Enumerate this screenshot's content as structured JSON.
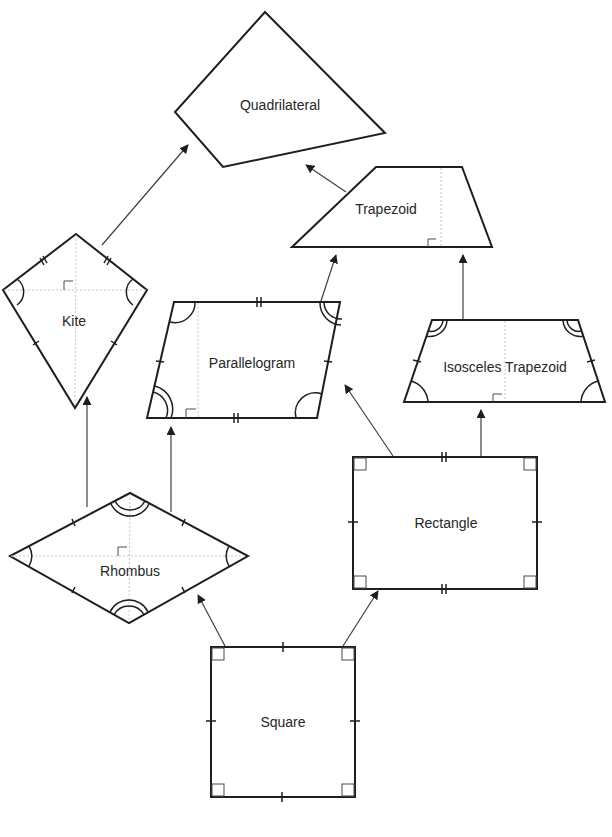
{
  "diagram": {
    "shapes": {
      "quadrilateral": {
        "label": "Quadrilateral"
      },
      "trapezoid": {
        "label": "Trapezoid"
      },
      "kite": {
        "label": "Kite"
      },
      "parallelogram": {
        "label": "Parallelogram"
      },
      "isosceles_trapezoid": {
        "label": "Isosceles Trapezoid"
      },
      "rhombus": {
        "label": "Rhombus"
      },
      "rectangle": {
        "label": "Rectangle"
      },
      "square": {
        "label": "Square"
      }
    },
    "arrows": [
      {
        "from": "Kite",
        "to": "Quadrilateral"
      },
      {
        "from": "Trapezoid",
        "to": "Quadrilateral"
      },
      {
        "from": "Parallelogram",
        "to": "Trapezoid"
      },
      {
        "from": "Isosceles Trapezoid",
        "to": "Trapezoid"
      },
      {
        "from": "Rhombus",
        "to": "Kite"
      },
      {
        "from": "Rhombus",
        "to": "Parallelogram"
      },
      {
        "from": "Rectangle",
        "to": "Parallelogram"
      },
      {
        "from": "Rectangle",
        "to": "Isosceles Trapezoid"
      },
      {
        "from": "Square",
        "to": "Rhombus"
      },
      {
        "from": "Square",
        "to": "Rectangle"
      }
    ],
    "colors": {
      "stroke": "#1e1e1e",
      "arrow": "#404040",
      "guide": "#c8c8c8",
      "background": "#ffffff"
    }
  }
}
